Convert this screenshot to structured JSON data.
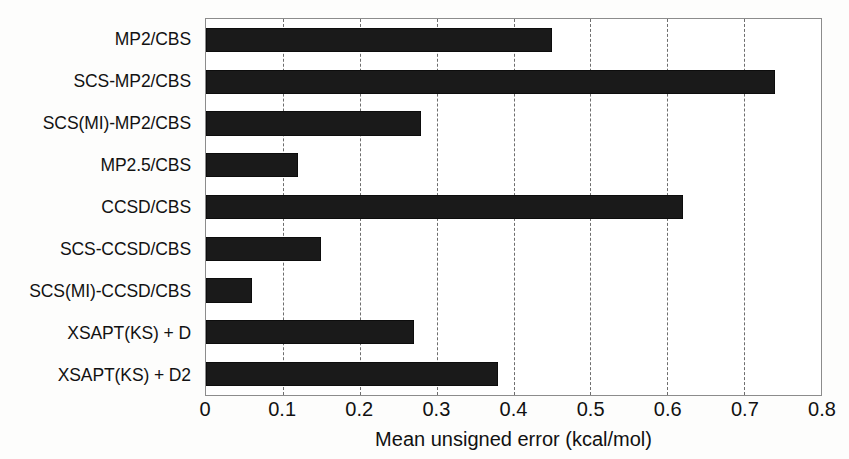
{
  "chart_data": {
    "type": "bar",
    "orientation": "horizontal",
    "title": "",
    "xlabel": "Mean unsigned error (kcal/mol)",
    "ylabel": "",
    "xlim": [
      0,
      0.8
    ],
    "xticks": [
      "0",
      "0.1",
      "0.2",
      "0.3",
      "0.4",
      "0.5",
      "0.6",
      "0.7",
      "0.8"
    ],
    "xtick_values": [
      0,
      0.1,
      0.2,
      0.3,
      0.4,
      0.5,
      0.6,
      0.7,
      0.8
    ],
    "grid": "vertical-dashed",
    "legend": "none",
    "bar_color": "#1a1a1a",
    "categories": [
      "MP2/CBS",
      "SCS-MP2/CBS",
      "SCS(MI)-MP2/CBS",
      "MP2.5/CBS",
      "CCSD/CBS",
      "SCS-CCSD/CBS",
      "SCS(MI)-CCSD/CBS",
      "XSAPT(KS) + D",
      "XSAPT(KS) + D2"
    ],
    "values": [
      0.45,
      0.74,
      0.28,
      0.12,
      0.62,
      0.15,
      0.06,
      0.27,
      0.38
    ]
  }
}
